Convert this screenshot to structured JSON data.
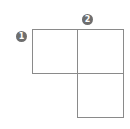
{
  "diagram": {
    "markers": [
      {
        "label": "1",
        "color": "#6e6e6e"
      },
      {
        "label": "2",
        "color": "#6e6e6e"
      }
    ],
    "boxes": [
      {
        "name": "top-left-square"
      },
      {
        "name": "top-right-square"
      },
      {
        "name": "bottom-right-square"
      }
    ],
    "line_color": "#8a8a8a"
  }
}
